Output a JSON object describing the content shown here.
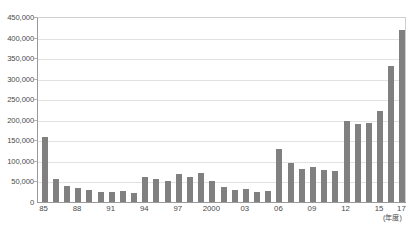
{
  "chart_data": {
    "type": "bar",
    "title": "",
    "xlabel": "年度",
    "ylabel": "",
    "ylim": [
      0,
      450000
    ],
    "ytick_step": 50000,
    "grid": true,
    "legend_position": "top",
    "bar_color": "#808080",
    "categories": [
      "85",
      "86",
      "87",
      "88",
      "89",
      "90",
      "91",
      "92",
      "93",
      "94",
      "95",
      "96",
      "97",
      "98",
      "99",
      "2000",
      "01",
      "02",
      "03",
      "04",
      "05",
      "06",
      "07",
      "08",
      "09",
      "10",
      "11",
      "12",
      "13",
      "14",
      "15",
      "16",
      "17"
    ],
    "xtick_labels": [
      "85",
      "88",
      "91",
      "94",
      "97",
      "2000",
      "03",
      "06",
      "09",
      "12",
      "15",
      "17"
    ],
    "values": [
      158000,
      55000,
      40000,
      35000,
      30000,
      25000,
      24000,
      26000,
      23000,
      62000,
      55000,
      50000,
      68000,
      60000,
      70000,
      52000,
      36000,
      30000,
      31000,
      25000,
      28000,
      128000,
      95000,
      80000,
      85000,
      77000,
      76000,
      198000,
      190000,
      192000,
      222000,
      330000,
      418000
    ]
  },
  "yaxis": {
    "ticks": [
      "450,000",
      "400,000",
      "350,000",
      "300,000",
      "250,000",
      "200,000",
      "150,000",
      "100,000",
      "50,000",
      "0"
    ]
  },
  "xaxis": {
    "unit": "(年度)"
  },
  "legend": {
    "series_1": "",
    "series_2": "",
    "series_3": "",
    "series_4": ""
  },
  "footnote": {
    "text": ""
  }
}
